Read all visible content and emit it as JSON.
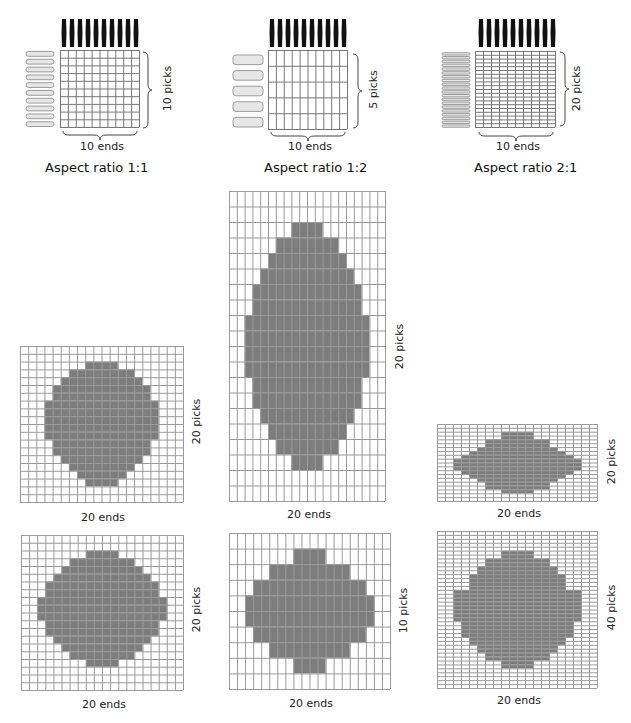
{
  "colors": {
    "fill": "#7d7d7d",
    "grid_line": "#9a9a9a",
    "warp": "#111111",
    "weft": "#e6e6e6"
  },
  "top_panels": [
    {
      "id": "ratio-1-1",
      "caption": "Aspect ratio 1:1",
      "ends_label": "10 ends",
      "picks_label": "10 picks",
      "ends": 10,
      "picks": 10
    },
    {
      "id": "ratio-1-2",
      "caption": "Aspect ratio 1:2",
      "ends_label": "10 ends",
      "picks_label": "5 picks",
      "ends": 10,
      "picks": 5
    },
    {
      "id": "ratio-2-1",
      "caption": "Aspect ratio 2:1",
      "ends_label": "10 ends",
      "picks_label": "20 picks",
      "ends": 10,
      "picks": 20
    }
  ],
  "grids": [
    {
      "id": "grid-1-1-a",
      "ends_label": "20 ends",
      "picks_label": "20 picks",
      "ends": 20,
      "picks": 20,
      "x": 20,
      "y": 346,
      "w": 163,
      "h": 156,
      "rows": {
        "2": [
          8,
          11
        ],
        "3": [
          6,
          13
        ],
        "4": [
          5,
          14
        ],
        "5": [
          4,
          15
        ],
        "6": [
          4,
          15
        ],
        "7": [
          3,
          16
        ],
        "8": [
          3,
          16
        ],
        "9": [
          3,
          16
        ],
        "10": [
          3,
          16
        ],
        "11": [
          3,
          16
        ],
        "12": [
          4,
          15
        ],
        "13": [
          4,
          15
        ],
        "14": [
          5,
          14
        ],
        "15": [
          6,
          13
        ],
        "16": [
          7,
          12
        ],
        "17": [
          8,
          11
        ]
      }
    },
    {
      "id": "grid-1-2-tall",
      "ends_label": "20 ends",
      "picks_label": "20 picks",
      "ends": 20,
      "picks": 20,
      "x": 229,
      "y": 191,
      "w": 156,
      "h": 310,
      "rows": {
        "2": [
          8,
          11
        ],
        "3": [
          6,
          13
        ],
        "4": [
          5,
          14
        ],
        "5": [
          4,
          15
        ],
        "6": [
          3,
          16
        ],
        "7": [
          3,
          16
        ],
        "8": [
          2,
          17
        ],
        "9": [
          2,
          17
        ],
        "10": [
          2,
          17
        ],
        "11": [
          2,
          17
        ],
        "12": [
          3,
          16
        ],
        "13": [
          3,
          16
        ],
        "14": [
          4,
          15
        ],
        "15": [
          5,
          14
        ],
        "16": [
          6,
          13
        ],
        "17": [
          8,
          11
        ]
      }
    },
    {
      "id": "grid-2-1-flat",
      "ends_label": "20 ends",
      "picks_label": "20 picks",
      "ends": 20,
      "picks": 20,
      "x": 437,
      "y": 424,
      "w": 160,
      "h": 77,
      "rows": {
        "2": [
          8,
          11
        ],
        "3": [
          8,
          11
        ],
        "4": [
          6,
          13
        ],
        "5": [
          6,
          13
        ],
        "6": [
          5,
          14
        ],
        "7": [
          4,
          15
        ],
        "8": [
          3,
          16
        ],
        "9": [
          2,
          17
        ],
        "10": [
          2,
          17
        ],
        "11": [
          2,
          17
        ],
        "12": [
          3,
          16
        ],
        "13": [
          4,
          15
        ],
        "14": [
          5,
          14
        ],
        "15": [
          6,
          13
        ],
        "16": [
          6,
          13
        ],
        "17": [
          8,
          11
        ]
      }
    },
    {
      "id": "grid-1-1-b",
      "ends_label": "20 ends",
      "picks_label": "20 picks",
      "ends": 20,
      "picks": 20,
      "x": 21,
      "y": 535,
      "w": 162,
      "h": 155,
      "rows": {
        "2": [
          8,
          11
        ],
        "3": [
          6,
          13
        ],
        "4": [
          5,
          14
        ],
        "5": [
          4,
          15
        ],
        "6": [
          3,
          16
        ],
        "7": [
          3,
          16
        ],
        "8": [
          2,
          17
        ],
        "9": [
          2,
          17
        ],
        "10": [
          2,
          17
        ],
        "11": [
          3,
          16
        ],
        "12": [
          3,
          16
        ],
        "13": [
          4,
          15
        ],
        "14": [
          5,
          14
        ],
        "15": [
          6,
          13
        ],
        "16": [
          8,
          11
        ]
      }
    },
    {
      "id": "grid-1-2-b",
      "ends_label": "20 ends",
      "picks_label": "10 picks",
      "ends": 20,
      "picks": 10,
      "x": 229,
      "y": 533,
      "w": 161,
      "h": 156,
      "rows": {
        "1": [
          8,
          11
        ],
        "2": [
          5,
          14
        ],
        "3": [
          3,
          16
        ],
        "4": [
          2,
          17
        ],
        "5": [
          2,
          17
        ],
        "6": [
          3,
          16
        ],
        "7": [
          5,
          14
        ],
        "8": [
          8,
          11
        ]
      }
    },
    {
      "id": "grid-2-1-b",
      "ends_label": "20 ends",
      "picks_label": "40 picks",
      "ends": 20,
      "picks": 40,
      "x": 437,
      "y": 531,
      "w": 160,
      "h": 157,
      "rows": {
        "5": [
          8,
          11
        ],
        "6": [
          8,
          11
        ],
        "7": [
          6,
          13
        ],
        "8": [
          6,
          13
        ],
        "9": [
          5,
          14
        ],
        "10": [
          5,
          14
        ],
        "11": [
          4,
          15
        ],
        "12": [
          4,
          15
        ],
        "13": [
          4,
          15
        ],
        "14": [
          4,
          15
        ],
        "15": [
          2,
          17
        ],
        "16": [
          2,
          17
        ],
        "17": [
          2,
          17
        ],
        "18": [
          2,
          17
        ],
        "19": [
          2,
          17
        ],
        "20": [
          2,
          17
        ],
        "21": [
          2,
          17
        ],
        "22": [
          2,
          17
        ],
        "23": [
          3,
          16
        ],
        "24": [
          3,
          16
        ],
        "25": [
          3,
          16
        ],
        "26": [
          3,
          16
        ],
        "27": [
          4,
          15
        ],
        "28": [
          4,
          15
        ],
        "29": [
          5,
          14
        ],
        "30": [
          5,
          14
        ],
        "31": [
          6,
          13
        ],
        "32": [
          6,
          13
        ],
        "33": [
          8,
          11
        ],
        "34": [
          8,
          11
        ]
      }
    }
  ]
}
